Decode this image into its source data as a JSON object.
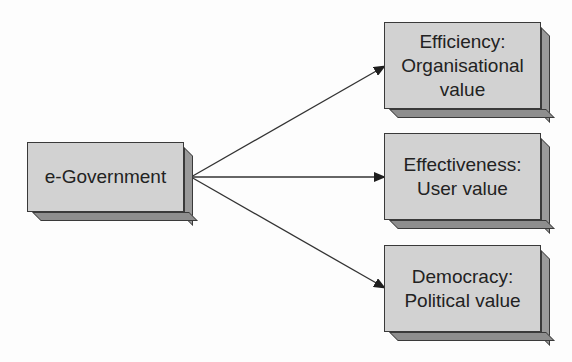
{
  "diagram": {
    "source": {
      "label": "e-Government"
    },
    "targets": [
      {
        "line1": "Efficiency:",
        "line2": "Organisational",
        "line3": "value"
      },
      {
        "line1": "Effectiveness:",
        "line2": "User value"
      },
      {
        "line1": "Democracy:",
        "line2": "Political value"
      }
    ],
    "edges": [
      {
        "from": "e-Government",
        "to": "Efficiency: Organisational value"
      },
      {
        "from": "e-Government",
        "to": "Effectiveness: User value"
      },
      {
        "from": "e-Government",
        "to": "Democracy: Political value"
      }
    ],
    "colors": {
      "box_fill": "#d2d2d2",
      "box_side": "#9a9a9a",
      "stroke": "#3a3a3a",
      "arrow": "#222222"
    }
  }
}
